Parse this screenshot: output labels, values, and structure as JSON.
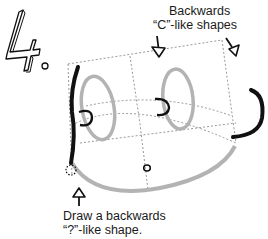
{
  "step": {
    "number": "4",
    "suffix": "."
  },
  "annotations": {
    "top": {
      "line1": "Backwards",
      "line2": "“C”-like shapes"
    },
    "bottom": {
      "line1": "Draw a backwards",
      "line2": "“?”-like shape."
    }
  },
  "colors": {
    "ink": "#111111",
    "guide": "#9a9a9a",
    "shape_gray": "#b3b3b3",
    "background": "#ffffff"
  },
  "icons": {
    "arrow_left_top": "arrow-down-icon",
    "arrow_right_top": "arrow-down-right-icon",
    "arrow_bottom": "arrow-up-icon"
  }
}
